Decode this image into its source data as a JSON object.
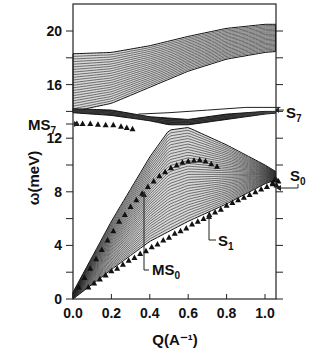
{
  "chart_data": {
    "type": "line",
    "title": "",
    "xlabel": "Q(A⁻¹)",
    "ylabel": "ω(meV)",
    "xlim": [
      0.0,
      1.1
    ],
    "ylim": [
      0,
      22
    ],
    "grid": false,
    "legend": "none (inline annotations)",
    "x_ticks": [
      0.0,
      0.2,
      0.4,
      0.6,
      0.8,
      1.0
    ],
    "x_tick_labels": [
      "0.0",
      "0.2",
      "0.4",
      "0.6",
      "0.8",
      "1.0"
    ],
    "y_ticks": [
      0,
      4,
      8,
      12,
      16,
      20
    ],
    "y_tick_labels": [
      "0",
      "4",
      "8",
      "12",
      "16",
      "20"
    ],
    "y_minor_ticks": [
      2,
      6,
      10,
      14,
      18
    ],
    "bands": [
      {
        "name": "upper continuum",
        "lower_edge": {
          "x": [
            0.0,
            0.2,
            0.4,
            0.6,
            0.8,
            1.0,
            1.08
          ],
          "y": [
            14.0,
            14.6,
            15.8,
            17.0,
            17.9,
            18.4,
            18.5
          ]
        },
        "upper_edge": {
          "x": [
            0.0,
            0.2,
            0.4,
            0.6,
            0.8,
            1.0,
            1.08
          ],
          "y": [
            18.3,
            18.4,
            18.9,
            19.6,
            20.2,
            20.5,
            20.5
          ]
        }
      },
      {
        "name": "middle continuum",
        "lower_edge": {
          "x": [
            0.0,
            0.2,
            0.4,
            0.5,
            0.6,
            0.8,
            1.0,
            1.08
          ],
          "y": [
            13.9,
            13.7,
            13.3,
            13.0,
            13.0,
            13.4,
            13.8,
            13.9
          ]
        },
        "upper_edge": {
          "x": [
            0.0,
            0.2,
            0.4,
            0.6,
            0.8,
            1.0,
            1.08
          ],
          "y": [
            14.2,
            14.1,
            13.6,
            13.4,
            13.8,
            14.0,
            14.0
          ]
        }
      },
      {
        "name": "lower continuum",
        "lower_edge": {
          "x": [
            0.0,
            0.2,
            0.4,
            0.6,
            0.8,
            1.0,
            1.08
          ],
          "y": [
            0.0,
            2.2,
            4.3,
            5.8,
            7.1,
            8.6,
            9.0
          ]
        },
        "upper_edge": {
          "x": [
            0.0,
            0.2,
            0.4,
            0.5,
            0.6,
            0.8,
            1.0,
            1.08
          ],
          "y": [
            0.5,
            5.8,
            10.6,
            12.6,
            12.8,
            11.5,
            10.0,
            9.3
          ]
        }
      }
    ],
    "series": [
      {
        "name": "MS7",
        "marker": "triangle",
        "x": [
          0.02,
          0.05,
          0.09,
          0.13,
          0.17,
          0.21,
          0.25,
          0.28,
          0.31
        ],
        "y": [
          13.1,
          13.1,
          13.1,
          13.05,
          13.0,
          13.0,
          12.9,
          12.8,
          12.7
        ]
      },
      {
        "name": "MS0",
        "marker": "triangle",
        "x": [
          0.03,
          0.06,
          0.09,
          0.12,
          0.15,
          0.18,
          0.21,
          0.24,
          0.27,
          0.3,
          0.33,
          0.36,
          0.39,
          0.42,
          0.45,
          0.48,
          0.51,
          0.54,
          0.57,
          0.6,
          0.63,
          0.66,
          0.69,
          0.72,
          0.75
        ],
        "y": [
          0.9,
          1.6,
          2.3,
          3.0,
          3.7,
          4.4,
          5.1,
          5.8,
          6.3,
          6.9,
          7.4,
          7.9,
          8.4,
          8.8,
          9.2,
          9.5,
          9.8,
          10.0,
          10.2,
          10.3,
          10.35,
          10.4,
          10.3,
          10.1,
          9.9
        ]
      },
      {
        "name": "S1",
        "marker": "triangle",
        "x": [
          0.08,
          0.11,
          0.14,
          0.17,
          0.2,
          0.23,
          0.26,
          0.29,
          0.32,
          0.35,
          0.38,
          0.41,
          0.44,
          0.47,
          0.5,
          0.53,
          0.56,
          0.59,
          0.62,
          0.65,
          0.68,
          0.71,
          0.74,
          0.77,
          0.8,
          0.83,
          0.86,
          0.89,
          0.92,
          0.95,
          0.98,
          1.01,
          1.04,
          1.06
        ],
        "y": [
          0.9,
          1.2,
          1.5,
          1.8,
          2.1,
          2.3,
          2.6,
          2.9,
          3.1,
          3.4,
          3.6,
          3.9,
          4.1,
          4.4,
          4.6,
          4.9,
          5.1,
          5.3,
          5.6,
          5.8,
          6.0,
          6.3,
          6.5,
          6.7,
          7.0,
          7.2,
          7.4,
          7.6,
          7.8,
          8.0,
          8.2,
          8.4,
          8.7,
          8.9
        ]
      },
      {
        "name": "S0",
        "marker": "triangle",
        "x": [
          1.04,
          1.05,
          1.06,
          1.07
        ],
        "y": [
          8.6,
          8.9,
          8.5,
          8.8
        ]
      },
      {
        "name": "S7 line",
        "marker": "none",
        "x": [
          0.34,
          0.5,
          0.7,
          0.9,
          1.08
        ],
        "y": [
          13.8,
          13.9,
          14.1,
          14.3,
          14.3
        ]
      }
    ],
    "annotations": [
      {
        "text": "MS",
        "sub": "7",
        "target": "MS7",
        "side": "left",
        "at_y": 13.2
      },
      {
        "text": "S",
        "sub": "7",
        "target": "S7 line",
        "side": "right",
        "at_y": 14.2
      },
      {
        "text": "S",
        "sub": "0",
        "target": "S0",
        "side": "right",
        "at_y": 9.2
      },
      {
        "text": "S",
        "sub": "1",
        "target": "S1",
        "side": "right",
        "at_x": 0.8
      },
      {
        "text": "MS",
        "sub": "0",
        "target": "MS0",
        "side": "below",
        "at_x": 0.39
      }
    ]
  },
  "labels": {
    "ylabel": "ω(meV)",
    "xlabel": "Q(A⁻¹)",
    "ann_ms7": "MS",
    "ann_ms7_sub": "7",
    "ann_s7": "S",
    "ann_s7_sub": "7",
    "ann_s0": "S",
    "ann_s0_sub": "0",
    "ann_s1": "S",
    "ann_s1_sub": "1",
    "ann_ms0": "MS",
    "ann_ms0_sub": "0"
  }
}
